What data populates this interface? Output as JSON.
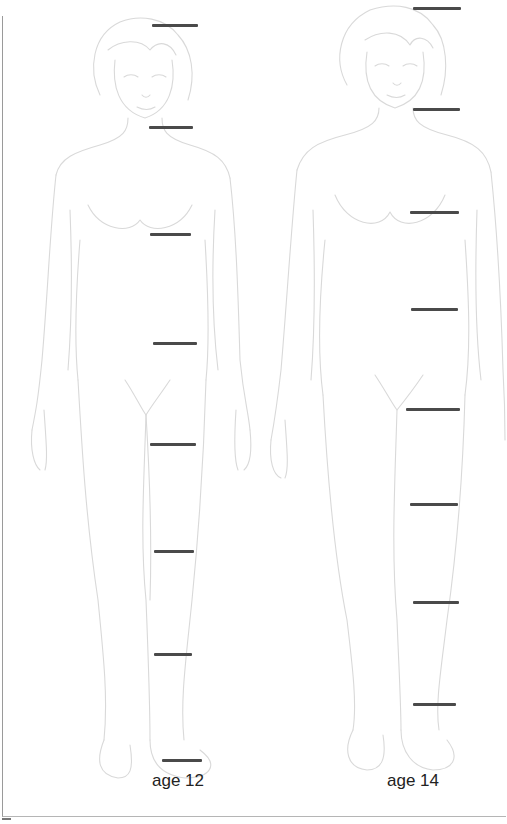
{
  "figures": [
    {
      "label": "age 12",
      "markers": [
        {
          "y": 25,
          "x1": 152,
          "x2": 198
        },
        {
          "y": 127,
          "x1": 149,
          "x2": 193
        },
        {
          "y": 234,
          "x1": 150,
          "x2": 191
        },
        {
          "y": 343,
          "x1": 153,
          "x2": 197
        },
        {
          "y": 444,
          "x1": 150,
          "x2": 196
        },
        {
          "y": 551,
          "x1": 154,
          "x2": 194
        },
        {
          "y": 654,
          "x1": 154,
          "x2": 192
        },
        {
          "y": 760,
          "x1": 162,
          "x2": 202
        }
      ]
    },
    {
      "label": "age 14",
      "markers": [
        {
          "y": 8,
          "x1": 413,
          "x2": 461
        },
        {
          "y": 109,
          "x1": 413,
          "x2": 460
        },
        {
          "y": 212,
          "x1": 410,
          "x2": 459
        },
        {
          "y": 309,
          "x1": 411,
          "x2": 458
        },
        {
          "y": 409,
          "x1": 406,
          "x2": 460
        },
        {
          "y": 504,
          "x1": 410,
          "x2": 458
        },
        {
          "y": 602,
          "x1": 413,
          "x2": 459
        },
        {
          "y": 704,
          "x1": 413,
          "x2": 456
        }
      ]
    }
  ],
  "colors": {
    "marker": "#4a4a4a",
    "outline": "#d9d9d9",
    "frame": "#9a9a9a"
  }
}
